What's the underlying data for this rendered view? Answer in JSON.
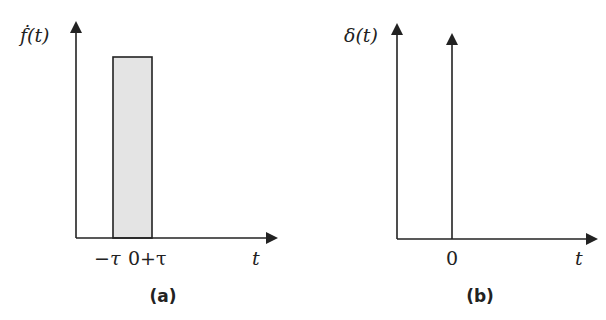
{
  "panel_a": {
    "caption": "(a)",
    "y_label": "ḟ(t)",
    "x_label": "t",
    "tick_left": "−τ",
    "tick_right": "0+τ",
    "pulse_fill": "#e4e4e4",
    "description": "rectangular pulse from −τ to 0+τ"
  },
  "panel_b": {
    "caption": "(b)",
    "y_label": "δ(t)",
    "x_label": "t",
    "tick_zero": "0",
    "description": "impulse (Dirac delta) at t = 0"
  },
  "colors": {
    "line": "#222222",
    "background": "#ffffff",
    "pulse_fill": "#e4e4e4"
  }
}
